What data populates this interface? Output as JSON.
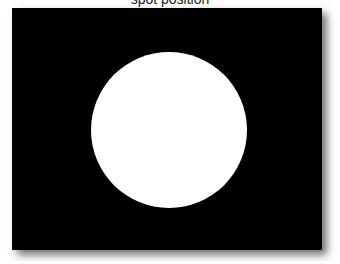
{
  "caption": "spot position",
  "figure": {
    "background_color": "#000000",
    "spot_color": "#ffffff",
    "spot_shape": "circle"
  }
}
